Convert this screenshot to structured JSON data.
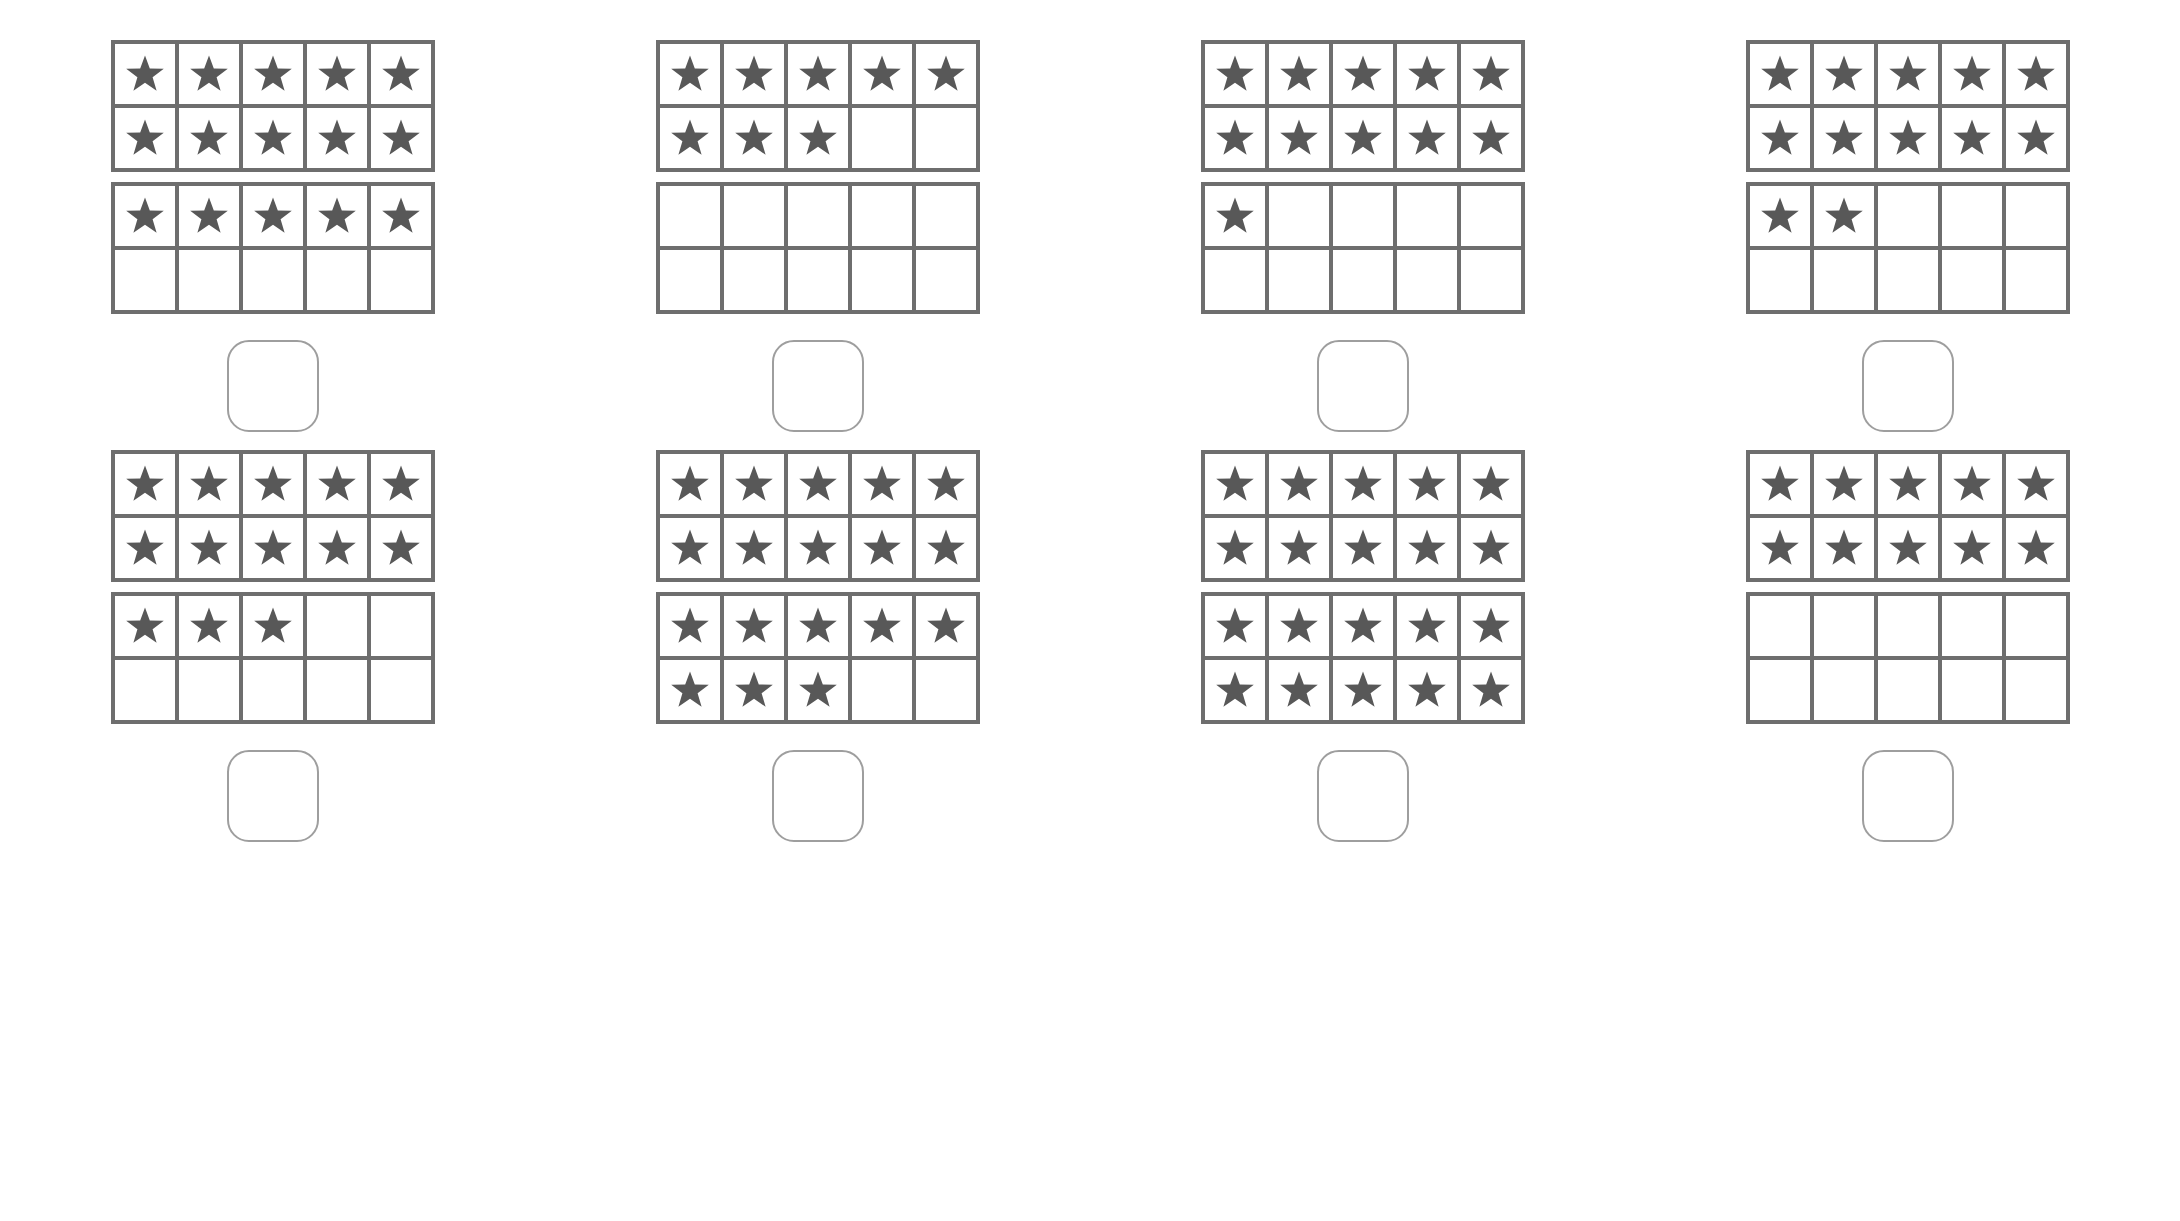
{
  "worksheet": {
    "title": "Ten Frame Counting Worksheet",
    "background_color": "#ffffff",
    "grid_border_color": "#6e6e6e",
    "star_color": "#585858",
    "answer_box_border_color": "#9e9e9e",
    "icon": "star-icon",
    "rows_per_frame": 2,
    "columns_per_frame": 5,
    "frames_per_problem": 2,
    "answer_box_value": ""
  },
  "problems": [
    {
      "index": 1,
      "frames": [
        {
          "filled": 10,
          "capacity": 10
        },
        {
          "filled": 5,
          "capacity": 10
        }
      ],
      "total_stars": 15,
      "answer_value": ""
    },
    {
      "index": 2,
      "frames": [
        {
          "filled": 8,
          "capacity": 10
        },
        {
          "filled": 0,
          "capacity": 10
        }
      ],
      "total_stars": 8,
      "answer_value": ""
    },
    {
      "index": 3,
      "frames": [
        {
          "filled": 10,
          "capacity": 10
        },
        {
          "filled": 1,
          "capacity": 10
        }
      ],
      "total_stars": 11,
      "answer_value": ""
    },
    {
      "index": 4,
      "frames": [
        {
          "filled": 10,
          "capacity": 10
        },
        {
          "filled": 2,
          "capacity": 10
        }
      ],
      "total_stars": 12,
      "answer_value": ""
    },
    {
      "index": 5,
      "frames": [
        {
          "filled": 10,
          "capacity": 10
        },
        {
          "filled": 3,
          "capacity": 10
        }
      ],
      "total_stars": 13,
      "answer_value": ""
    },
    {
      "index": 6,
      "frames": [
        {
          "filled": 10,
          "capacity": 10
        },
        {
          "filled": 8,
          "capacity": 10
        }
      ],
      "total_stars": 18,
      "answer_value": ""
    },
    {
      "index": 7,
      "frames": [
        {
          "filled": 10,
          "capacity": 10
        },
        {
          "filled": 10,
          "capacity": 10
        }
      ],
      "total_stars": 20,
      "answer_value": ""
    },
    {
      "index": 8,
      "frames": [
        {
          "filled": 10,
          "capacity": 10
        },
        {
          "filled": 0,
          "capacity": 10
        }
      ],
      "total_stars": 10,
      "answer_value": ""
    }
  ]
}
